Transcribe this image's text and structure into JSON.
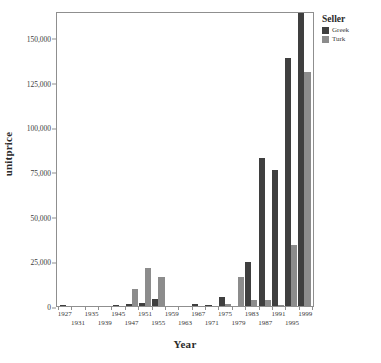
{
  "chart_data": {
    "type": "bar",
    "title": "",
    "xlabel": "Year",
    "ylabel": "unitprice",
    "ylim": [
      0,
      165000
    ],
    "yticks": [
      0,
      25000,
      50000,
      75000,
      100000,
      125000,
      150000
    ],
    "ytick_labels": [
      "0",
      "25,000",
      "50,000",
      "75,000",
      "100,000",
      "125,000",
      "150,000"
    ],
    "grid": false,
    "legend_position": "right",
    "legend_title": "Seller",
    "categories": [
      "1927",
      "1931",
      "1935",
      "1939",
      "1945",
      "1947",
      "1951",
      "1955",
      "1959",
      "1963",
      "1967",
      "1971",
      "1975",
      "1979",
      "1983",
      "1987",
      "1991",
      "1995",
      "1999"
    ],
    "xtick_labels_row0": [
      "1927",
      "1935",
      "1945",
      "1951",
      "1959",
      "1967",
      "1975",
      "1983",
      "1991",
      "1999"
    ],
    "xtick_labels_row1": [
      "1931",
      "1939",
      "1947",
      "1955",
      "1963",
      "1971",
      "1979",
      "1987",
      "1995"
    ],
    "series": [
      {
        "name": "Greek",
        "color": "#3f3f3f",
        "values": [
          700,
          0,
          0,
          0,
          600,
          900,
          1500,
          4200,
          0,
          0,
          900,
          400,
          5200,
          0,
          24600,
          83000,
          76000,
          138500,
          164000
        ]
      },
      {
        "name": "Turk",
        "color": "#8c8c8c",
        "values": [
          0,
          0,
          0,
          0,
          0,
          9500,
          21500,
          16500,
          0,
          0,
          0,
          0,
          1300,
          16300,
          3500,
          3300,
          400,
          34000,
          131000
        ]
      }
    ]
  },
  "legend": {
    "title": "Seller",
    "entries": [
      {
        "label": "Greek",
        "color": "#3f3f3f"
      },
      {
        "label": "Turk",
        "color": "#8c8c8c"
      }
    ]
  },
  "axes": {
    "y_title": "unitprice",
    "x_title": "Year"
  }
}
